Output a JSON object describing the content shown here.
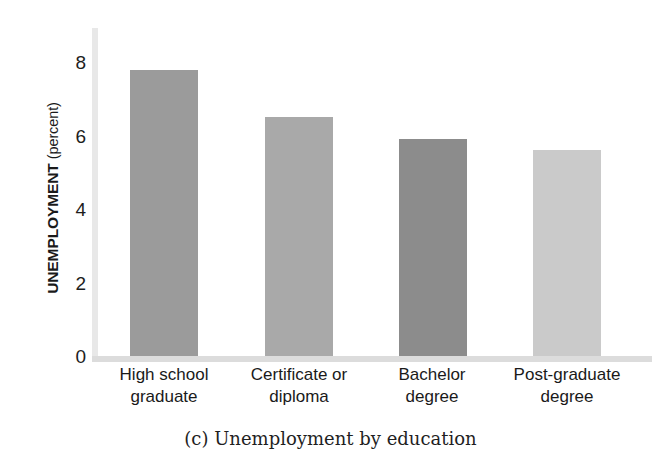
{
  "chart_data": {
    "type": "bar",
    "title": "(c) Unemployment by education",
    "xlabel": "",
    "ylabel": "UNEMPLOYMENT (percent)",
    "ylabel_main": "UNEMPLOYMENT",
    "ylabel_unit": "(percent)",
    "categories": [
      "High school graduate",
      "Certificate or diploma",
      "Bachelor degree",
      "Post-graduate degree"
    ],
    "category_lines": [
      [
        "High school",
        "graduate"
      ],
      [
        "Certificate or",
        "diploma"
      ],
      [
        "Bachelor",
        "degree"
      ],
      [
        "Post-graduate",
        "degree"
      ]
    ],
    "values": [
      7.8,
      6.5,
      5.9,
      5.6
    ],
    "bar_colors": [
      "#9b9b9b",
      "#a9a9a9",
      "#8c8c8c",
      "#cacaca"
    ],
    "ylim": [
      0,
      8.8
    ],
    "yticks": [
      0,
      2,
      4,
      6,
      8
    ],
    "ytick_labels": [
      "0",
      "2",
      "4",
      "6",
      "8"
    ],
    "grid": false,
    "legend": "none",
    "axis_color": "#e2e2e2"
  },
  "caption": {
    "text": "(c) Unemployment by education"
  }
}
